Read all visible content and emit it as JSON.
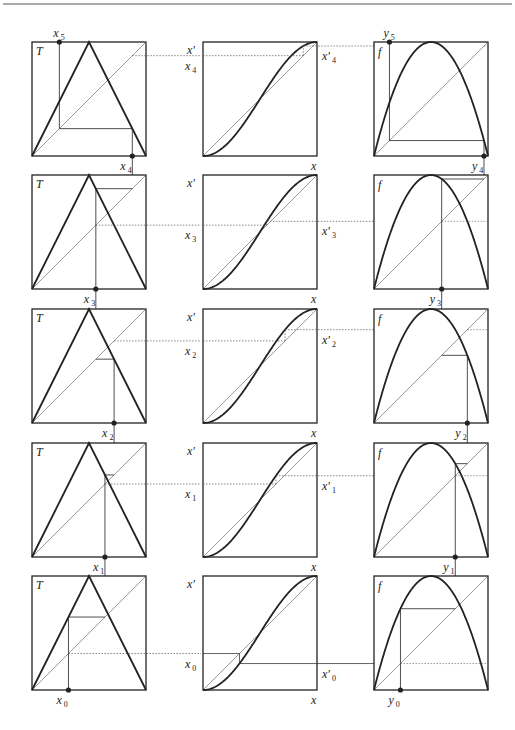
{
  "figure": {
    "colors": {
      "ink": "#222222",
      "thin": "#555555",
      "background": "#ffffff"
    },
    "layout": {
      "box_size": 114,
      "columns_x": [
        32,
        203,
        374
      ],
      "rows_y": [
        42,
        175,
        309,
        443,
        576
      ],
      "header_rule_y": 4
    },
    "panels": {
      "tent": {
        "label": "T",
        "map": "tent"
      },
      "conjugacy": {
        "y_label": "x'",
        "x_label": "x"
      },
      "logistic": {
        "label": "f",
        "map": "logistic"
      }
    },
    "orbit_x": [
      0.32,
      0.64,
      0.72,
      0.56,
      0.88,
      0.24
    ],
    "rows": [
      {
        "step": 4,
        "x_label": "x",
        "x_sub": "4",
        "x_next_label": "x",
        "x_next_sub": "5",
        "xp_label": "x'",
        "xp_sub": "4",
        "y_label": "y",
        "y_sub": "4",
        "y_next_label": "y",
        "y_next_sub": "5"
      },
      {
        "step": 3,
        "x_label": "x",
        "x_sub": "3",
        "xp_label": "x'",
        "xp_sub": "3",
        "y_label": "y",
        "y_sub": "3"
      },
      {
        "step": 2,
        "x_label": "x",
        "x_sub": "2",
        "xp_label": "x'",
        "xp_sub": "2",
        "y_label": "y",
        "y_sub": "2"
      },
      {
        "step": 1,
        "x_label": "x",
        "x_sub": "1",
        "xp_label": "x'",
        "xp_sub": "1",
        "y_label": "y",
        "y_sub": "1"
      },
      {
        "step": 0,
        "x_label": "x",
        "x_sub": "0",
        "xp_label": "x'",
        "xp_sub": "0",
        "y_label": "y",
        "y_sub": "0"
      }
    ]
  }
}
